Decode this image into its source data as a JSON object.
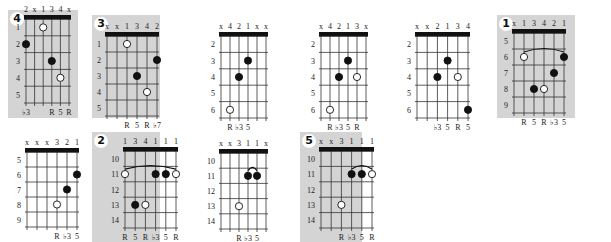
{
  "colors": {
    "panel_shade": "#d4d4d4",
    "line": "#333333",
    "nut": "#111111",
    "dot_filled": "#111111",
    "dot_open": "#ffffff"
  },
  "diagrams": [
    {
      "id": "d4",
      "badge": "4",
      "shaded": true,
      "panel": [
        8,
        10,
        70,
        108
      ],
      "grid": [
        26,
        19,
        43,
        84
      ],
      "frets": 5,
      "start_fret": 1,
      "fret_labels": [
        "1",
        "2",
        "3",
        "4",
        "5"
      ],
      "top": [
        "2",
        "x",
        "1",
        "3",
        "4",
        "x"
      ],
      "bottom": [
        "♭3",
        "",
        "",
        "R",
        "5",
        "R"
      ],
      "dots": [
        {
          "s": 1,
          "f": 2,
          "t": "filled"
        },
        {
          "s": 3,
          "f": 1,
          "t": "open"
        },
        {
          "s": 4,
          "f": 3,
          "t": "filled"
        },
        {
          "s": 5,
          "f": 4,
          "t": "open"
        }
      ],
      "barre": null
    },
    {
      "id": "d3",
      "badge": "3",
      "shaded": true,
      "panel": [
        92,
        15,
        68,
        103
      ],
      "grid": [
        107,
        36,
        50,
        80
      ],
      "frets": 5,
      "start_fret": 1,
      "fret_labels": [
        "1",
        "2",
        "3",
        "4",
        "5"
      ],
      "top": [
        "x",
        "x",
        "1",
        "3",
        "4",
        "2"
      ],
      "bottom": [
        "",
        "",
        "R",
        "5",
        "R",
        "♭7"
      ],
      "dots": [
        {
          "s": 3,
          "f": 1,
          "t": "open"
        },
        {
          "s": 6,
          "f": 2,
          "t": "filled"
        },
        {
          "s": 4,
          "f": 3,
          "t": "filled"
        },
        {
          "s": 5,
          "f": 4,
          "t": "open"
        }
      ],
      "barre": null
    },
    {
      "id": "dA",
      "badge": null,
      "shaded": false,
      "panel": [
        205,
        20,
        95,
        100
      ],
      "grid": [
        221,
        36,
        45,
        82
      ],
      "frets": 5,
      "start_fret": 2,
      "fret_labels": [
        "2",
        "3",
        "4",
        "5",
        "6"
      ],
      "top": [
        "x",
        "4",
        "2",
        "1",
        "x",
        "x"
      ],
      "bottom": [
        "",
        "R",
        "♭3",
        "5",
        "",
        ""
      ],
      "dots": [
        {
          "s": 4,
          "f": 2,
          "t": "filled"
        },
        {
          "s": 3,
          "f": 3,
          "t": "filled"
        },
        {
          "s": 2,
          "f": 5,
          "t": "open"
        }
      ],
      "barre": null
    },
    {
      "id": "dB",
      "badge": null,
      "shaded": false,
      "panel": [
        305,
        20,
        95,
        100
      ],
      "grid": [
        321,
        36,
        45,
        82
      ],
      "frets": 5,
      "start_fret": 2,
      "fret_labels": [
        "2",
        "3",
        "4",
        "5",
        "6"
      ],
      "top": [
        "x",
        "4",
        "2",
        "1",
        "3",
        "x"
      ],
      "bottom": [
        "",
        "R",
        "♭3",
        "5",
        "R",
        ""
      ],
      "dots": [
        {
          "s": 4,
          "f": 2,
          "t": "filled"
        },
        {
          "s": 3,
          "f": 3,
          "t": "filled"
        },
        {
          "s": 5,
          "f": 3,
          "t": "open"
        },
        {
          "s": 2,
          "f": 5,
          "t": "open"
        }
      ],
      "barre": null
    },
    {
      "id": "dC",
      "badge": null,
      "shaded": false,
      "panel": [
        405,
        20,
        95,
        100
      ],
      "grid": [
        417,
        36,
        51,
        82
      ],
      "frets": 5,
      "start_fret": 2,
      "fret_labels": [
        "2",
        "3",
        "4",
        "5",
        "6"
      ],
      "top": [
        "x",
        "x",
        "2",
        "1",
        "3",
        "4"
      ],
      "bottom": [
        "",
        "",
        "♭3",
        "5",
        "R",
        "5"
      ],
      "dots": [
        {
          "s": 4,
          "f": 2,
          "t": "filled"
        },
        {
          "s": 3,
          "f": 3,
          "t": "filled"
        },
        {
          "s": 5,
          "f": 3,
          "t": "open"
        },
        {
          "s": 6,
          "f": 5,
          "t": "filled"
        }
      ],
      "barre": null
    },
    {
      "id": "d1",
      "badge": "1",
      "shaded": true,
      "panel": [
        497,
        15,
        78,
        103
      ],
      "grid": [
        514,
        33,
        50,
        80
      ],
      "frets": 5,
      "start_fret": 5,
      "fret_labels": [
        "5",
        "6",
        "7",
        "8",
        "9"
      ],
      "top": [
        "x",
        "1",
        "3",
        "4",
        "2",
        "1"
      ],
      "bottom": [
        "",
        "R",
        "5",
        "R",
        "♭3",
        "5"
      ],
      "dots": [
        {
          "s": 2,
          "f": 2,
          "t": "open"
        },
        {
          "s": 6,
          "f": 2,
          "t": "filled"
        },
        {
          "s": 5,
          "f": 3,
          "t": "filled"
        },
        {
          "s": 3,
          "f": 4,
          "t": "filled"
        },
        {
          "s": 4,
          "f": 4,
          "t": "open"
        }
      ],
      "barre": {
        "from": 2,
        "to": 6,
        "f": 2
      }
    },
    {
      "id": "dD",
      "badge": null,
      "shaded": false,
      "panel": [
        10,
        140,
        80,
        102
      ],
      "grid": [
        27,
        152,
        50,
        75
      ],
      "frets": 5,
      "start_fret": 5,
      "fret_labels": [
        "5",
        "6",
        "7",
        "8",
        "9"
      ],
      "top": [
        "x",
        "x",
        "x",
        "3",
        "2",
        "1"
      ],
      "bottom": [
        "",
        "",
        "",
        "R",
        "♭3",
        "5"
      ],
      "dots": [
        {
          "s": 6,
          "f": 2,
          "t": "filled"
        },
        {
          "s": 5,
          "f": 3,
          "t": "filled"
        },
        {
          "s": 4,
          "f": 4,
          "t": "open"
        }
      ],
      "barre": null
    },
    {
      "id": "d2",
      "badge": "2",
      "shaded": true,
      "panel": [
        92,
        132,
        68,
        110
      ],
      "grid": [
        125,
        151,
        51,
        77
      ],
      "frets": 5,
      "start_fret": 10,
      "fret_labels": [
        "10",
        "11",
        "12",
        "13",
        "14"
      ],
      "top": [
        "1",
        "3",
        "4",
        "1",
        "1",
        "1"
      ],
      "bottom": [
        "R",
        "5",
        "R",
        "♭3",
        "5",
        "R"
      ],
      "dots": [
        {
          "s": 1,
          "f": 2,
          "t": "open"
        },
        {
          "s": 4,
          "f": 2,
          "t": "filled"
        },
        {
          "s": 5,
          "f": 2,
          "t": "filled"
        },
        {
          "s": 6,
          "f": 2,
          "t": "open"
        },
        {
          "s": 2,
          "f": 4,
          "t": "filled"
        },
        {
          "s": 3,
          "f": 4,
          "t": "open"
        }
      ],
      "barre": {
        "from": 1,
        "to": 6,
        "f": 2
      }
    },
    {
      "id": "dE",
      "badge": null,
      "shaded": false,
      "panel": [
        205,
        140,
        95,
        102
      ],
      "grid": [
        221,
        153,
        45,
        76
      ],
      "frets": 5,
      "start_fret": 10,
      "fret_labels": [
        "10",
        "11",
        "12",
        "13",
        "14"
      ],
      "top": [
        "x",
        "x",
        "3",
        "1",
        "1",
        "x"
      ],
      "bottom": [
        "",
        "",
        "R",
        "♭3",
        "5",
        ""
      ],
      "dots": [
        {
          "s": 4,
          "f": 2,
          "t": "filled"
        },
        {
          "s": 5,
          "f": 2,
          "t": "filled"
        },
        {
          "s": 3,
          "f": 4,
          "t": "open"
        }
      ],
      "barre": {
        "from": 4,
        "to": 5,
        "f": 2
      }
    },
    {
      "id": "d5",
      "badge": "5",
      "shaded": true,
      "panel": [
        300,
        132,
        62,
        110
      ],
      "grid": [
        321,
        151,
        51,
        77
      ],
      "frets": 5,
      "start_fret": 10,
      "fret_labels": [
        "10",
        "11",
        "12",
        "13",
        "14"
      ],
      "top": [
        "x",
        "x",
        "3",
        "1",
        "1",
        "1"
      ],
      "bottom": [
        "",
        "",
        "R",
        "♭3",
        "5",
        "R"
      ],
      "dots": [
        {
          "s": 4,
          "f": 2,
          "t": "filled"
        },
        {
          "s": 5,
          "f": 2,
          "t": "filled"
        },
        {
          "s": 6,
          "f": 2,
          "t": "open"
        },
        {
          "s": 3,
          "f": 4,
          "t": "open"
        }
      ],
      "barre": {
        "from": 4,
        "to": 6,
        "f": 2
      }
    }
  ]
}
